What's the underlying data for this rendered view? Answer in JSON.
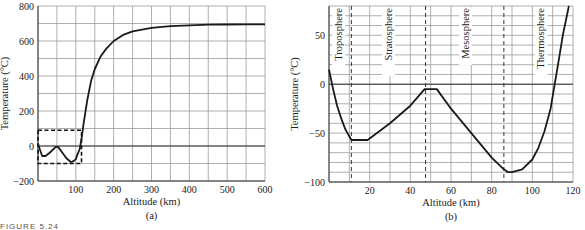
{
  "figure_caption": "FIGURE 5.24",
  "chart_data": [
    {
      "id": "a",
      "type": "line",
      "panel_label": "(a)",
      "title": "",
      "xlabel": "Altitude (km)",
      "ylabel": "Temperature (°C)",
      "xlim": [
        0,
        600
      ],
      "ylim": [
        -200,
        800
      ],
      "xticks": [
        100,
        200,
        300,
        400,
        500,
        600
      ],
      "yticks": [
        -200,
        0,
        200,
        400,
        600,
        800
      ],
      "grid": {
        "x_step": 50,
        "y_step": 100
      },
      "x": [
        0,
        5,
        11,
        20,
        30,
        47,
        53,
        65,
        75,
        86,
        90,
        95,
        100,
        105,
        110,
        115,
        120,
        130,
        140,
        150,
        165,
        180,
        200,
        225,
        250,
        300,
        350,
        400,
        450,
        500,
        550,
        600
      ],
      "values": [
        15,
        -20,
        -57,
        -57,
        -40,
        -5,
        -5,
        -40,
        -70,
        -90,
        -90,
        -85,
        -75,
        -45,
        -20,
        40,
        120,
        260,
        370,
        440,
        510,
        555,
        600,
        635,
        655,
        675,
        685,
        690,
        693,
        694,
        695,
        695
      ],
      "annotations": [
        {
          "type": "dashed-box",
          "x0": 0,
          "x1": 115,
          "y0": -100,
          "y1": 90,
          "note": "Region enlarged in (b)"
        }
      ]
    },
    {
      "id": "b",
      "type": "line",
      "panel_label": "(b)",
      "title": "",
      "xlabel": "Altitude (km)",
      "ylabel": "Temperature (°C)",
      "xlim": [
        0,
        120
      ],
      "ylim": [
        -100,
        80
      ],
      "xticks": [
        20,
        40,
        60,
        80,
        100,
        120
      ],
      "yticks": [
        -100,
        -50,
        0,
        50
      ],
      "grid": {
        "x_step": 10,
        "y_step": 10
      },
      "x": [
        0,
        2,
        4,
        6,
        8,
        11,
        19,
        30,
        40,
        47,
        53,
        60,
        70,
        80,
        86,
        88,
        90,
        95,
        100,
        103,
        106,
        109,
        111,
        113,
        115,
        118
      ],
      "values": [
        15,
        -5,
        -22,
        -35,
        -46,
        -57,
        -57,
        -40,
        -22,
        -5,
        -5,
        -25,
        -50,
        -75,
        -87,
        -90,
        -90,
        -87,
        -77,
        -65,
        -48,
        -25,
        0,
        25,
        50,
        80
      ],
      "layer_boundaries": [
        11,
        47.5,
        86
      ],
      "region_labels": [
        {
          "label": "Troposphere",
          "x": 4.5
        },
        {
          "label": "Stratosphere",
          "x": 29
        },
        {
          "label": "Mesosphere",
          "x": 67
        },
        {
          "label": "Thermosphere",
          "x": 104
        }
      ]
    }
  ]
}
